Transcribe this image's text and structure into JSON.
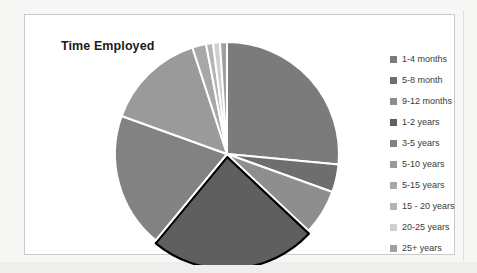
{
  "chart": {
    "title": "Time Employed",
    "frame_border_color": "#c9c9c9",
    "background": "#ffffff"
  },
  "legend": {
    "position": "right",
    "items": [
      {
        "label": "1-4 months",
        "color": "#7b7b7b"
      },
      {
        "label": "5-8 month",
        "color": "#6e6e6e"
      },
      {
        "label": "9-12 months",
        "color": "#8e8e8e"
      },
      {
        "label": "1-2 years",
        "color": "#5f5f5f"
      },
      {
        "label": "3-5 years",
        "color": "#828282"
      },
      {
        "label": "5-10 years",
        "color": "#9a9a9a"
      },
      {
        "label": "5-15 years",
        "color": "#a8a8a8"
      },
      {
        "label": "15 - 20 years",
        "color": "#b4b4b4"
      },
      {
        "label": "20-25 years",
        "color": "#cfcfcf"
      },
      {
        "label": "25+ years",
        "color": "#a0a0a0"
      }
    ]
  },
  "chart_data": {
    "type": "pie",
    "title": "Time Employed",
    "xlabel": "",
    "ylabel": "",
    "legend_position": "right",
    "grid": false,
    "start_angle_deg": 0,
    "direction": "clockwise",
    "categories": [
      "1-4 months",
      "5-8 month",
      "9-12 months",
      "1-2 years",
      "3-5 years",
      "5-10 years",
      "5-15 years",
      "15 - 20 years",
      "20-25 years",
      "25+ years"
    ],
    "values": [
      26.5,
      4.0,
      6.5,
      24.0,
      19.5,
      14.5,
      2.0,
      1.0,
      1.0,
      1.0
    ],
    "units": "percent",
    "colors": [
      "#7b7b7b",
      "#6e6e6e",
      "#8e8e8e",
      "#5f5f5f",
      "#828282",
      "#9a9a9a",
      "#a8a8a8",
      "#b4b4b4",
      "#cfcfcf",
      "#a0a0a0"
    ],
    "slice_outline_color": "#ffffff",
    "highlighted_slice": "1-2 years",
    "highlighted_slice_outline": "#000000",
    "data_labels_shown": false
  }
}
